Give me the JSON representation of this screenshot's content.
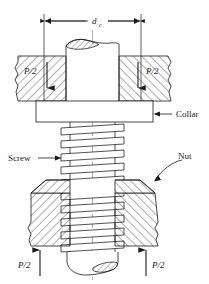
{
  "figure": {
    "type": "engineering-cross-section-diagram",
    "background_color": "#ffffff",
    "line_color": "#1a1a1a",
    "hatch_color": "#1a1a1a",
    "centerline_color": "#8a8a8a"
  },
  "dimension": {
    "label_main": "d",
    "label_sub": "c",
    "full_label": "d_c",
    "description": "collar diameter dimension across top",
    "arrow_left_x": 44,
    "arrow_right_x": 141,
    "line_y": 21
  },
  "labels": {
    "collar": "Collar",
    "screw": "Screw",
    "nut": "Nut",
    "force_top_left": "P/2",
    "force_top_right": "P/2",
    "force_bottom_left": "P/2",
    "force_bottom_right": "P/2"
  },
  "parts": [
    {
      "name": "upper-cylinder",
      "label": ""
    },
    {
      "name": "left-clamped-member",
      "label": "P/2"
    },
    {
      "name": "right-clamped-member",
      "label": "P/2"
    },
    {
      "name": "collar-plate",
      "label": "Collar"
    },
    {
      "name": "threaded-screw",
      "label": "Screw"
    },
    {
      "name": "nut-body",
      "label": "Nut"
    },
    {
      "name": "lower-cylinder",
      "label": ""
    }
  ],
  "force_arrows": [
    {
      "name": "arrow-top-left",
      "direction": "down",
      "value": "P/2"
    },
    {
      "name": "arrow-top-right",
      "direction": "down",
      "value": "P/2"
    },
    {
      "name": "arrow-bottom-left",
      "direction": "up",
      "value": "P/2"
    },
    {
      "name": "arrow-bottom-right",
      "direction": "up",
      "value": "P/2"
    }
  ]
}
